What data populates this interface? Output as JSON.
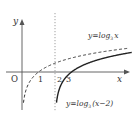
{
  "diagram": {
    "type": "function-graph",
    "axes": {
      "x_label": "x",
      "y_label": "y",
      "origin_label": "O",
      "x_ticks": [
        "1",
        "2",
        "3"
      ]
    },
    "asymptote": {
      "x": 2,
      "style": "dotted"
    },
    "curves": [
      {
        "label_prefix": "y=log",
        "base": "3",
        "label_arg": "x",
        "style": "dashed",
        "shift": 0
      },
      {
        "label_prefix": "y=log",
        "base": "3",
        "label_arg": "(x−2)",
        "style": "solid",
        "shift": 2
      }
    ],
    "colors": {
      "ink": "#333333",
      "axis": "#555555",
      "background": "#ffffff"
    }
  }
}
